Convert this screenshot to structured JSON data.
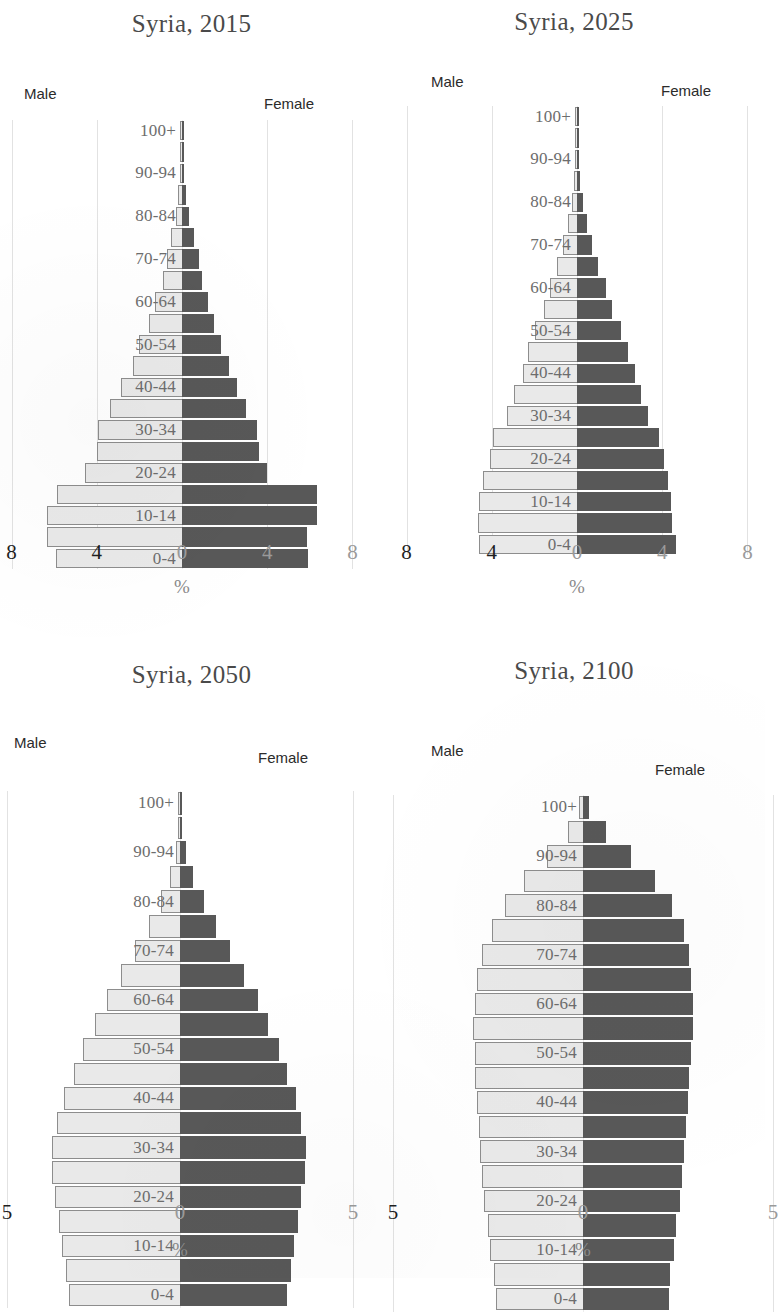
{
  "page": {
    "subject": "Syria",
    "colors": {
      "male_bar": "#e9e9e9",
      "male_border": "#8d8d8d",
      "female_bar": "#585858",
      "gridline": "#e2e2e2",
      "title": "#4a4a4a",
      "age_label": "#6d6d6d"
    }
  },
  "chart_data": [
    {
      "type": "bar",
      "orientation": "population-pyramid",
      "title": "Syria, 2015",
      "xlabel": "%",
      "ylabel": "",
      "legend": {
        "left": "Male",
        "right": "Female"
      },
      "legend_position": "top-left / top-right",
      "grid": true,
      "xlim": [
        -8,
        8
      ],
      "xticks": [
        8,
        4,
        0,
        4,
        8
      ],
      "xtick_labels": [
        "8",
        "4",
        "0",
        "4",
        "8"
      ],
      "categories": [
        "0-4",
        "5-9",
        "10-14",
        "15-19",
        "20-24",
        "25-29",
        "30-34",
        "35-39",
        "40-44",
        "45-49",
        "50-54",
        "55-59",
        "60-64",
        "65-69",
        "70-74",
        "75-79",
        "80-84",
        "85-89",
        "90-94",
        "95-99",
        "100+"
      ],
      "visible_category_labels": [
        "0-4",
        "10-14",
        "20-24",
        "30-34",
        "40-44",
        "50-54",
        "60-64",
        "70-74",
        "80-84",
        "90-94",
        "100+"
      ],
      "series": [
        {
          "name": "Male",
          "values": [
            5.9,
            6.35,
            6.35,
            5.85,
            4.55,
            4.0,
            3.95,
            3.4,
            2.85,
            2.3,
            2.0,
            1.55,
            1.25,
            0.9,
            0.7,
            0.5,
            0.3,
            0.17,
            0.07,
            0.02,
            0.01
          ]
        },
        {
          "name": "Female",
          "values": [
            5.9,
            5.85,
            6.35,
            6.35,
            4.0,
            3.6,
            3.5,
            3.0,
            2.6,
            2.2,
            1.85,
            1.5,
            1.2,
            0.95,
            0.8,
            0.55,
            0.35,
            0.2,
            0.08,
            0.02,
            0.01
          ]
        }
      ]
    },
    {
      "type": "bar",
      "orientation": "population-pyramid",
      "title": "Syria, 2025",
      "xlabel": "%",
      "ylabel": "",
      "legend": {
        "left": "Male",
        "right": "Female"
      },
      "legend_position": "top-left / top-right",
      "grid": true,
      "xlim": [
        -8,
        8
      ],
      "xticks": [
        8,
        4,
        0,
        4,
        8
      ],
      "xtick_labels": [
        "8",
        "4",
        "0",
        "4",
        "8"
      ],
      "categories": [
        "0-4",
        "5-9",
        "10-14",
        "15-19",
        "20-24",
        "25-29",
        "30-34",
        "35-39",
        "40-44",
        "45-49",
        "50-54",
        "55-59",
        "60-64",
        "65-69",
        "70-74",
        "75-79",
        "80-84",
        "85-89",
        "90-94",
        "95-99",
        "100+"
      ],
      "visible_category_labels": [
        "0-4",
        "10-14",
        "20-24",
        "30-34",
        "40-44",
        "50-54",
        "60-64",
        "70-74",
        "80-84",
        "90-94",
        "100+"
      ],
      "series": [
        {
          "name": "Male",
          "values": [
            4.6,
            4.65,
            4.6,
            4.4,
            4.1,
            3.95,
            3.3,
            2.95,
            2.55,
            2.3,
            1.95,
            1.55,
            1.25,
            0.95,
            0.65,
            0.4,
            0.25,
            0.12,
            0.05,
            0.02,
            0.01
          ]
        },
        {
          "name": "Female",
          "values": [
            4.65,
            4.45,
            4.4,
            4.25,
            4.1,
            3.85,
            3.35,
            3.0,
            2.7,
            2.4,
            2.05,
            1.65,
            1.35,
            1.0,
            0.7,
            0.45,
            0.28,
            0.14,
            0.06,
            0.02,
            0.01
          ]
        }
      ]
    },
    {
      "type": "bar",
      "orientation": "population-pyramid",
      "title": "Syria, 2050",
      "xlabel": "%",
      "ylabel": "",
      "legend": {
        "left": "Male",
        "right": "Female"
      },
      "legend_position": "top-left / top-right",
      "grid": true,
      "xlim": [
        -5,
        5
      ],
      "xticks": [
        5,
        0,
        5
      ],
      "xtick_labels": [
        "5",
        "0",
        "5"
      ],
      "categories": [
        "0-4",
        "5-9",
        "10-14",
        "15-19",
        "20-24",
        "25-29",
        "30-34",
        "35-39",
        "40-44",
        "45-49",
        "50-54",
        "55-59",
        "60-64",
        "65-69",
        "70-74",
        "75-79",
        "80-84",
        "85-89",
        "90-94",
        "95-99",
        "100+"
      ],
      "visible_category_labels": [
        "0-4",
        "10-14",
        "20-24",
        "30-34",
        "40-44",
        "50-54",
        "60-64",
        "70-74",
        "80-84",
        "90-94",
        "100+"
      ],
      "series": [
        {
          "name": "Male",
          "values": [
            3.2,
            3.3,
            3.4,
            3.5,
            3.6,
            3.7,
            3.7,
            3.55,
            3.35,
            3.05,
            2.8,
            2.45,
            2.1,
            1.7,
            1.3,
            0.9,
            0.55,
            0.28,
            0.12,
            0.04,
            0.01
          ]
        },
        {
          "name": "Female",
          "values": [
            3.1,
            3.2,
            3.3,
            3.4,
            3.5,
            3.6,
            3.65,
            3.5,
            3.35,
            3.1,
            2.85,
            2.55,
            2.25,
            1.85,
            1.45,
            1.05,
            0.7,
            0.38,
            0.16,
            0.05,
            0.02
          ]
        }
      ]
    },
    {
      "type": "bar",
      "orientation": "population-pyramid",
      "title": "Syria, 2100",
      "xlabel": "%",
      "ylabel": "",
      "legend": {
        "left": "Male",
        "right": "Female"
      },
      "legend_position": "top-left / top-right",
      "grid": true,
      "xlim": [
        -5,
        5
      ],
      "xticks": [
        5,
        0,
        5
      ],
      "xtick_labels": [
        "5",
        "0",
        "5"
      ],
      "categories": [
        "0-4",
        "5-9",
        "10-14",
        "15-19",
        "20-24",
        "25-29",
        "30-34",
        "35-39",
        "40-44",
        "45-49",
        "50-54",
        "55-59",
        "60-64",
        "65-69",
        "70-74",
        "75-79",
        "80-84",
        "85-89",
        "90-94",
        "95-99",
        "100+"
      ],
      "visible_category_labels": [
        "0-4",
        "10-14",
        "20-24",
        "30-34",
        "40-44",
        "50-54",
        "60-64",
        "70-74",
        "80-84",
        "90-94",
        "100+"
      ],
      "series": [
        {
          "name": "Male",
          "values": [
            2.3,
            2.35,
            2.45,
            2.5,
            2.6,
            2.65,
            2.7,
            2.75,
            2.8,
            2.85,
            2.85,
            2.9,
            2.85,
            2.8,
            2.65,
            2.4,
            2.05,
            1.55,
            0.95,
            0.4,
            0.1
          ]
        },
        {
          "name": "Female",
          "values": [
            2.25,
            2.3,
            2.4,
            2.45,
            2.55,
            2.6,
            2.65,
            2.7,
            2.75,
            2.8,
            2.85,
            2.9,
            2.9,
            2.85,
            2.8,
            2.65,
            2.35,
            1.9,
            1.25,
            0.6,
            0.15
          ]
        }
      ]
    }
  ]
}
